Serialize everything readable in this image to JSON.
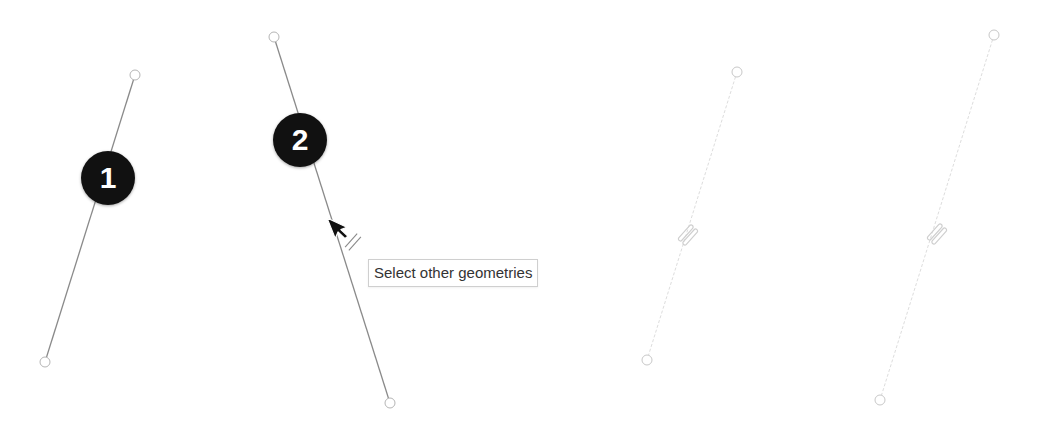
{
  "scene": {
    "width": 1037,
    "height": 429,
    "background": "#ffffff"
  },
  "colors": {
    "line_active": "#8a8a8a",
    "line_faded": "#dddddd",
    "endpoint_active": "#b5b5b5",
    "endpoint_faded": "#c8c8c8",
    "badge_fill": "#111111",
    "badge_text": "#ffffff",
    "constraint_active": "#8a8a8a",
    "constraint_faded": "#cfcfcf",
    "cursor": "#111111"
  },
  "lines": [
    {
      "id": "line-1",
      "x1": 135,
      "y1": 75,
      "x2": 45,
      "y2": 362,
      "state": "active"
    },
    {
      "id": "line-2",
      "x1": 274,
      "y1": 37,
      "x2": 390,
      "y2": 403,
      "state": "active"
    },
    {
      "id": "line-3",
      "x1": 737,
      "y1": 72,
      "x2": 647,
      "y2": 360,
      "state": "faded"
    },
    {
      "id": "line-4",
      "x1": 994,
      "y1": 35,
      "x2": 880,
      "y2": 400,
      "state": "faded"
    }
  ],
  "badges": [
    {
      "label": "1",
      "cx": 108,
      "cy": 178
    },
    {
      "label": "2",
      "cx": 300,
      "cy": 140
    }
  ],
  "constraints": [
    {
      "type": "parallel",
      "cx": 353,
      "cy": 242,
      "state": "active"
    },
    {
      "type": "parallel",
      "cx": 688,
      "cy": 235,
      "state": "faded"
    },
    {
      "type": "parallel",
      "cx": 937,
      "cy": 234,
      "state": "faded"
    }
  ],
  "cursor": {
    "type": "arrow",
    "x": 327,
    "y": 218
  },
  "tooltip": {
    "text": "Select other geometries"
  }
}
